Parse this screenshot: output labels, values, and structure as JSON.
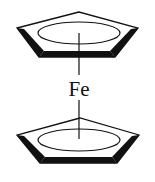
{
  "diagram": {
    "center_atom": {
      "label": "Fe"
    },
    "rings": [
      {
        "name": "top-cyclopentadienyl-ring",
        "type": "pentagon-with-aromatic-ellipse"
      },
      {
        "name": "bottom-cyclopentadienyl-ring",
        "type": "pentagon-with-aromatic-ellipse"
      }
    ],
    "colors": {
      "stroke": "#111111",
      "background": "#ffffff"
    }
  }
}
